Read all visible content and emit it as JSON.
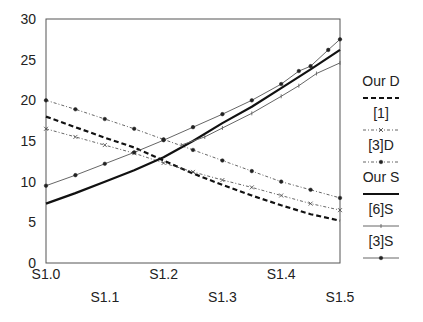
{
  "chart_data": {
    "type": "line",
    "title": "",
    "xlabel": "",
    "ylabel": "",
    "categories": [
      "S1.0",
      "S1.1",
      "S1.2",
      "S1.3",
      "S1.4",
      "S1.5"
    ],
    "x": [
      1.0,
      1.1,
      1.2,
      1.3,
      1.4,
      1.5
    ],
    "ylim": [
      0,
      30
    ],
    "yticks": [
      0,
      5,
      10,
      15,
      20,
      25,
      30
    ],
    "grid": false,
    "legend_position": "right",
    "series": [
      {
        "name": "Our D",
        "style": "dashed-bold",
        "marker": "none",
        "points": [
          [
            1.0,
            18.0
          ],
          [
            1.05,
            16.7
          ],
          [
            1.1,
            15.4
          ],
          [
            1.15,
            14.2
          ],
          [
            1.2,
            12.6
          ],
          [
            1.25,
            11.0
          ],
          [
            1.3,
            9.6
          ],
          [
            1.35,
            8.3
          ],
          [
            1.4,
            7.1
          ],
          [
            1.45,
            6.0
          ],
          [
            1.5,
            5.2
          ]
        ]
      },
      {
        "name": "[1]",
        "style": "dash-dot-thin",
        "marker": "x",
        "points": [
          [
            1.0,
            16.5
          ],
          [
            1.05,
            15.5
          ],
          [
            1.1,
            14.5
          ],
          [
            1.15,
            13.5
          ],
          [
            1.2,
            12.3
          ],
          [
            1.25,
            11.2
          ],
          [
            1.3,
            10.2
          ],
          [
            1.35,
            9.3
          ],
          [
            1.4,
            8.3
          ],
          [
            1.45,
            7.3
          ],
          [
            1.5,
            6.5
          ]
        ]
      },
      {
        "name": "[3]D",
        "style": "dash-dot-thin",
        "marker": "dot",
        "points": [
          [
            1.0,
            20.0
          ],
          [
            1.05,
            18.9
          ],
          [
            1.1,
            17.7
          ],
          [
            1.15,
            16.5
          ],
          [
            1.2,
            15.2
          ],
          [
            1.25,
            13.9
          ],
          [
            1.3,
            12.6
          ],
          [
            1.35,
            11.3
          ],
          [
            1.4,
            10.0
          ],
          [
            1.45,
            9.0
          ],
          [
            1.5,
            8.0
          ]
        ]
      },
      {
        "name": "Our S",
        "style": "solid-bold",
        "marker": "none",
        "points": [
          [
            1.0,
            7.3
          ],
          [
            1.05,
            8.6
          ],
          [
            1.1,
            10.0
          ],
          [
            1.15,
            11.4
          ],
          [
            1.2,
            13.0
          ],
          [
            1.25,
            15.0
          ],
          [
            1.3,
            17.2
          ],
          [
            1.35,
            19.2
          ],
          [
            1.4,
            21.5
          ],
          [
            1.45,
            23.8
          ],
          [
            1.5,
            26.2
          ]
        ]
      },
      {
        "name": "[6]S",
        "style": "solid-thin",
        "marker": "tick",
        "points": [
          [
            1.23,
            14.5
          ],
          [
            1.27,
            15.5
          ],
          [
            1.3,
            16.6
          ],
          [
            1.35,
            18.4
          ],
          [
            1.4,
            20.5
          ],
          [
            1.43,
            21.8
          ],
          [
            1.46,
            23.3
          ],
          [
            1.5,
            24.6
          ]
        ]
      },
      {
        "name": "[3]S",
        "style": "solid-thin",
        "marker": "dot",
        "points": [
          [
            1.0,
            9.5
          ],
          [
            1.05,
            10.8
          ],
          [
            1.1,
            12.2
          ],
          [
            1.15,
            13.6
          ],
          [
            1.2,
            15.1
          ],
          [
            1.25,
            16.7
          ],
          [
            1.3,
            18.3
          ],
          [
            1.35,
            20.0
          ],
          [
            1.4,
            22.0
          ],
          [
            1.43,
            23.6
          ],
          [
            1.45,
            24.2
          ],
          [
            1.48,
            26.2
          ],
          [
            1.5,
            27.5
          ]
        ]
      }
    ]
  }
}
